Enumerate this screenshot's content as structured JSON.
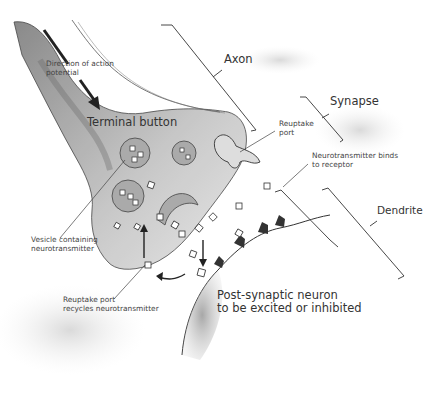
{
  "diagram": {
    "labels": {
      "direction": "Direction of action\npotential",
      "direction_line1": "Direction of action",
      "direction_line2": "potential",
      "terminal_button": "Terminal button",
      "axon": "Axon",
      "synapse": "Synapse",
      "reuptake_port_line1": "Reuptake",
      "reuptake_port_line2": "port",
      "binds_line1": "Neurotransmitter binds",
      "binds_line2": "to receptor",
      "dendrite": "Dendrite",
      "vesicle_line1": "Vesicle containing",
      "vesicle_line2": "neurotransmitter",
      "recycle_line1": "Reuptake port",
      "recycle_line2": "recycles neurotransmitter",
      "post_line1": "Post-synaptic neuron",
      "post_line2": "to be excited or inhibited"
    },
    "colors": {
      "ink": "#2a2a2a",
      "shade": "#9a9a9a",
      "text": "#3a3a3a"
    }
  }
}
